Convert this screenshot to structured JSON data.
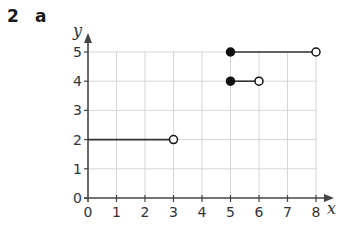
{
  "question": {
    "number": "2",
    "part": "a"
  },
  "chart_data": {
    "type": "line",
    "title": "",
    "xlabel": "x",
    "ylabel": "y",
    "xlim": [
      0,
      8
    ],
    "ylim": [
      0,
      5
    ],
    "xticks": [
      "0",
      "1",
      "2",
      "3",
      "4",
      "5",
      "6",
      "7",
      "8"
    ],
    "yticks": [
      "0",
      "1",
      "2",
      "3",
      "4",
      "5"
    ],
    "grid": true,
    "series": [
      {
        "name": "segment-1",
        "x": [
          0,
          3
        ],
        "y": [
          2,
          2
        ],
        "start": "none",
        "end": "open"
      },
      {
        "name": "segment-2",
        "x": [
          5,
          6
        ],
        "y": [
          4,
          4
        ],
        "start": "closed",
        "end": "open"
      },
      {
        "name": "segment-3",
        "x": [
          5,
          8
        ],
        "y": [
          5,
          5
        ],
        "start": "closed",
        "end": "open"
      }
    ],
    "colors": {
      "line": "#333333",
      "grid": "#d6d6d6",
      "axis": "#444444"
    }
  }
}
